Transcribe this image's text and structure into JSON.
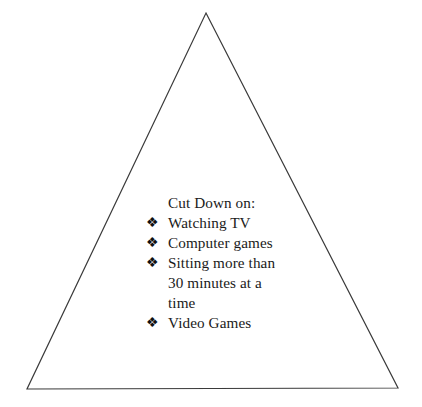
{
  "diagram": {
    "type": "pyramid",
    "shape_name": "triangle",
    "background_color": "#ffffff",
    "stroke_color": "#3a3a3a",
    "stroke_width": 1,
    "fill_color": "none",
    "vertices": {
      "apex": [
        206,
        13
      ],
      "bottom_left": [
        27,
        389
      ],
      "bottom_right": [
        398,
        388
      ]
    }
  },
  "content": {
    "heading": "Cut Down on:",
    "bullet_glyph": "❖",
    "items": [
      "Watching TV",
      "Computer games",
      "Sitting more than 30 minutes at a time",
      "Video Games"
    ]
  }
}
